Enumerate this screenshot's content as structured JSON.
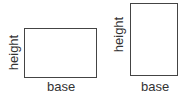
{
  "figures": [
    {
      "name": "wide-rectangle",
      "height_label": "height",
      "base_label": "base"
    },
    {
      "name": "tall-rectangle",
      "height_label": "height",
      "base_label": "base"
    }
  ],
  "colors": {
    "stroke": "#444444",
    "text": "#333333",
    "background": "#ffffff"
  }
}
